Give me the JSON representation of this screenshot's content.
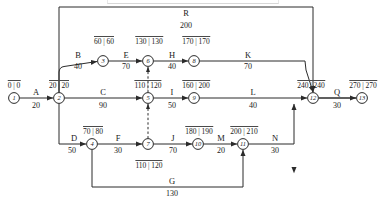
{
  "diagram": {
    "stroke_color": "#2b2b2b",
    "text_color": "#1a1a1a"
  },
  "nodes": [
    {
      "id": "1",
      "label": "1",
      "x": 14,
      "y": 98
    },
    {
      "id": "2",
      "label": "2",
      "x": 59,
      "y": 98
    },
    {
      "id": "3",
      "label": "3",
      "x": 103,
      "y": 61
    },
    {
      "id": "4",
      "label": "4",
      "x": 92,
      "y": 144
    },
    {
      "id": "5",
      "label": "5",
      "x": 148,
      "y": 98
    },
    {
      "id": "6",
      "label": "6",
      "x": 148,
      "y": 61
    },
    {
      "id": "7",
      "label": "7",
      "x": 148,
      "y": 144
    },
    {
      "id": "8",
      "label": "8",
      "x": 194,
      "y": 61
    },
    {
      "id": "9",
      "label": "9",
      "x": 194,
      "y": 98
    },
    {
      "id": "10",
      "label": "10",
      "x": 198,
      "y": 144
    },
    {
      "id": "11",
      "label": "11",
      "x": 243,
      "y": 144
    },
    {
      "id": "12",
      "label": "12",
      "x": 313,
      "y": 98
    },
    {
      "id": "13",
      "label": "13",
      "x": 362,
      "y": 98
    }
  ],
  "activities": [
    {
      "key": "A",
      "name": "A",
      "duration": "20",
      "from": "1",
      "to": "2",
      "name_x": 36,
      "name_y": 92,
      "dur_x": 36,
      "dur_y": 106
    },
    {
      "key": "B",
      "name": "B",
      "duration": "40",
      "from": "2",
      "to": "3",
      "name_x": 78,
      "name_y": 55,
      "dur_x": 78,
      "dur_y": 67
    },
    {
      "key": "C",
      "name": "C",
      "duration": "90",
      "from": "2",
      "to": "5",
      "name_x": 103,
      "name_y": 92,
      "dur_x": 103,
      "dur_y": 106
    },
    {
      "key": "D",
      "name": "D",
      "duration": "50",
      "from": "2",
      "to": "4",
      "name_x": 74,
      "name_y": 138,
      "dur_x": 72,
      "dur_y": 151
    },
    {
      "key": "E",
      "name": "E",
      "duration": "70",
      "from": "3",
      "to": "6",
      "name_x": 126,
      "name_y": 55,
      "dur_x": 126,
      "dur_y": 67
    },
    {
      "key": "F",
      "name": "F",
      "duration": "30",
      "from": "4",
      "to": "7",
      "name_x": 118,
      "name_y": 138,
      "dur_x": 118,
      "dur_y": 151
    },
    {
      "key": "G",
      "name": "G",
      "duration": "130",
      "from": "4",
      "to": "11",
      "name_x": 172,
      "name_y": 181,
      "dur_x": 172,
      "dur_y": 194
    },
    {
      "key": "H",
      "name": "H",
      "duration": "40",
      "from": "6",
      "to": "8",
      "name_x": 172,
      "name_y": 55,
      "dur_x": 172,
      "dur_y": 67
    },
    {
      "key": "I",
      "name": "I",
      "duration": "50",
      "from": "5",
      "to": "9",
      "name_x": 172,
      "name_y": 92,
      "dur_x": 172,
      "dur_y": 106
    },
    {
      "key": "J",
      "name": "J",
      "duration": "70",
      "from": "7",
      "to": "10",
      "name_x": 173,
      "name_y": 138,
      "dur_x": 173,
      "dur_y": 151
    },
    {
      "key": "K",
      "name": "K",
      "duration": "70",
      "from": "8",
      "to": "12",
      "name_x": 248,
      "name_y": 55,
      "dur_x": 248,
      "dur_y": 67
    },
    {
      "key": "L",
      "name": "L",
      "duration": "40",
      "from": "9",
      "to": "12",
      "name_x": 253,
      "name_y": 92,
      "dur_x": 253,
      "dur_y": 106
    },
    {
      "key": "M",
      "name": "M",
      "duration": "20",
      "from": "10",
      "to": "11",
      "name_x": 221,
      "name_y": 138,
      "dur_x": 221,
      "dur_y": 151
    },
    {
      "key": "N",
      "name": "N",
      "duration": "30",
      "from": "11",
      "to": "12",
      "name_x": 275,
      "name_y": 138,
      "dur_x": 275,
      "dur_y": 151
    },
    {
      "key": "Q",
      "name": "Q",
      "duration": "30",
      "from": "12",
      "to": "13",
      "name_x": 337,
      "name_y": 92,
      "dur_x": 337,
      "dur_y": 106
    },
    {
      "key": "R",
      "name": "R",
      "duration": "200",
      "from": "2",
      "to": "12",
      "name_x": 186,
      "name_y": 13,
      "dur_x": 186,
      "dur_y": 26
    }
  ],
  "dummies": [
    {
      "key": "d1",
      "from": "7",
      "to": "5",
      "style": "dashed"
    },
    {
      "key": "d2",
      "from": "5",
      "to": "6",
      "style": "dashed"
    }
  ],
  "event_times": [
    {
      "node": "1",
      "early": "0",
      "late": "0",
      "x": 14,
      "y": 85
    },
    {
      "node": "2",
      "early": "20",
      "late": "20",
      "x": 59,
      "y": 85
    },
    {
      "node": "3",
      "early": "60",
      "late": "60",
      "x": 104,
      "y": 41
    },
    {
      "node": "4",
      "early": "70",
      "late": "80",
      "x": 93,
      "y": 131
    },
    {
      "node": "5",
      "early": "110",
      "late": "120",
      "x": 148,
      "y": 85
    },
    {
      "node": "6",
      "early": "130",
      "late": "130",
      "x": 149,
      "y": 41
    },
    {
      "node": "7",
      "early": "110",
      "late": "120",
      "x": 149,
      "y": 165
    },
    {
      "node": "8",
      "early": "170",
      "late": "170",
      "x": 196,
      "y": 41
    },
    {
      "node": "9",
      "early": "160",
      "late": "200",
      "x": 196,
      "y": 85
    },
    {
      "node": "10",
      "early": "180",
      "late": "190",
      "x": 199,
      "y": 131
    },
    {
      "node": "11",
      "early": "200",
      "late": "210",
      "x": 244,
      "y": 131
    },
    {
      "node": "12",
      "early": "240",
      "late": "240",
      "x": 311,
      "y": 85
    },
    {
      "node": "13",
      "early": "270",
      "late": "270",
      "x": 363,
      "y": 85
    }
  ]
}
